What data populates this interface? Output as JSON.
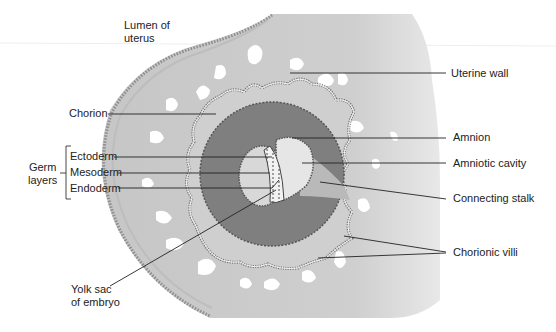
{
  "diagram": {
    "labels": {
      "lumen": [
        "Lumen of",
        "uterus"
      ],
      "uterine_wall": "Uterine wall",
      "chorion": "Chorion",
      "amnion": "Amnion",
      "amniotic_cavity": "Amniotic cavity",
      "connecting_stalk": "Connecting stalk",
      "chorionic_villi": "Chorionic villi",
      "germ_layers": [
        "Germ",
        "layers"
      ],
      "ectoderm": "Ectoderm",
      "mesoderm": "Mesoderm",
      "endoderm": "Endoderm",
      "yolk_sac": [
        "Yolk sac",
        "of embryo"
      ]
    },
    "colors": {
      "uterine_tissue": "#c9c9c9",
      "uterine_outer_band": "#b5b5b5",
      "chorionic_cavity": "#7f7f7f",
      "amniotic_cavity": "#e6e6e6",
      "yolk_sac": "#d8d8d8",
      "lacunae": "#ffffff",
      "leader_line": "#222222",
      "text": "#222222"
    }
  }
}
